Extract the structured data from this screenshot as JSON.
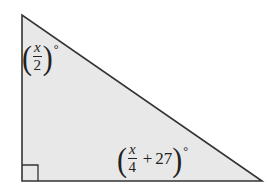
{
  "diagram": {
    "type": "right-triangle",
    "fill_color": "#e8e8e8",
    "stroke_color": "#333333",
    "vertices": {
      "top": [
        22,
        15
      ],
      "right_angle": [
        22,
        181
      ],
      "right": [
        262,
        181
      ]
    },
    "right_angle_marker": true,
    "angles": {
      "top": {
        "numerator": "x",
        "denominator": "2",
        "unit": "°"
      },
      "bottom_right": {
        "numerator": "x",
        "denominator": "4",
        "plus": "+",
        "constant": "27",
        "unit": "°"
      }
    }
  }
}
